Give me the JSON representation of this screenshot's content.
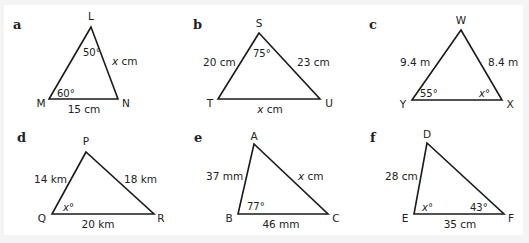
{
  "figure": {
    "problems": [
      {
        "label": "a",
        "label_pos": [
          13,
          29
        ],
        "vertices": [
          {
            "name": "L",
            "x": 91,
            "y": 27,
            "label_x": 91,
            "label_y": 20,
            "anchor": "middle"
          },
          {
            "name": "M",
            "x": 49,
            "y": 99,
            "label_x": 41,
            "label_y": 107,
            "anchor": "middle"
          },
          {
            "name": "N",
            "x": 118,
            "y": 99,
            "label_x": 126,
            "label_y": 107,
            "anchor": "middle"
          }
        ],
        "measures": [
          {
            "text": "x cm",
            "italic_prefix": "x",
            "rest": " cm",
            "x": 112,
            "y": 65,
            "anchor": "start",
            "kind": "side"
          },
          {
            "text": "15 cm",
            "italic_prefix": "",
            "rest": "15 cm",
            "x": 84,
            "y": 113,
            "anchor": "middle",
            "kind": "side"
          }
        ],
        "angles": [
          {
            "text": "50°",
            "italic_prefix": "",
            "rest": "50°",
            "x": 83,
            "y": 56,
            "anchor": "start"
          },
          {
            "text": "60°",
            "italic_prefix": "",
            "rest": "60°",
            "x": 57,
            "y": 97,
            "anchor": "start"
          }
        ]
      },
      {
        "label": "b",
        "label_pos": [
          193,
          29
        ],
        "vertices": [
          {
            "name": "S",
            "x": 259,
            "y": 33,
            "label_x": 259,
            "label_y": 27,
            "anchor": "middle"
          },
          {
            "name": "T",
            "x": 218,
            "y": 99,
            "label_x": 210,
            "label_y": 107,
            "anchor": "middle"
          },
          {
            "name": "U",
            "x": 320,
            "y": 99,
            "label_x": 329,
            "label_y": 107,
            "anchor": "middle"
          }
        ],
        "measures": [
          {
            "text": "20 cm",
            "italic_prefix": "",
            "rest": "20 cm",
            "x": 203,
            "y": 66,
            "anchor": "start",
            "kind": "side"
          },
          {
            "text": "23 cm",
            "italic_prefix": "",
            "rest": "23 cm",
            "x": 297,
            "y": 66,
            "anchor": "start",
            "kind": "side"
          },
          {
            "text": "x cm",
            "italic_prefix": "x",
            "rest": " cm",
            "x": 270,
            "y": 113,
            "anchor": "middle",
            "kind": "side"
          }
        ],
        "angles": [
          {
            "text": "75°",
            "italic_prefix": "",
            "rest": "75°",
            "x": 253,
            "y": 57,
            "anchor": "start"
          }
        ]
      },
      {
        "label": "c",
        "label_pos": [
          369,
          29
        ],
        "vertices": [
          {
            "name": "W",
            "x": 461,
            "y": 30,
            "label_x": 461,
            "label_y": 24,
            "anchor": "middle"
          },
          {
            "name": "Y",
            "x": 412,
            "y": 100,
            "label_x": 403,
            "label_y": 108,
            "anchor": "middle"
          },
          {
            "name": "X",
            "x": 502,
            "y": 100,
            "label_x": 510,
            "label_y": 108,
            "anchor": "middle"
          }
        ],
        "measures": [
          {
            "text": "9.4 m",
            "italic_prefix": "",
            "rest": "9.4 m",
            "x": 400,
            "y": 66,
            "anchor": "start",
            "kind": "side"
          },
          {
            "text": "8.4 m",
            "italic_prefix": "",
            "rest": "8.4 m",
            "x": 488,
            "y": 66,
            "anchor": "start",
            "kind": "side"
          }
        ],
        "angles": [
          {
            "text": "55°",
            "italic_prefix": "",
            "rest": "55°",
            "x": 420,
            "y": 97,
            "anchor": "start"
          },
          {
            "text": "x°",
            "italic_prefix": "x",
            "rest": "°",
            "x": 479,
            "y": 97,
            "anchor": "start"
          }
        ]
      },
      {
        "label": "d",
        "label_pos": [
          17,
          142
        ],
        "vertices": [
          {
            "name": "P",
            "x": 86,
            "y": 152,
            "label_x": 86,
            "label_y": 145,
            "anchor": "middle"
          },
          {
            "name": "Q",
            "x": 52,
            "y": 214,
            "label_x": 42,
            "label_y": 222,
            "anchor": "middle"
          },
          {
            "name": "R",
            "x": 154,
            "y": 214,
            "label_x": 161,
            "label_y": 222,
            "anchor": "middle"
          }
        ],
        "measures": [
          {
            "text": "14 km",
            "italic_prefix": "",
            "rest": "14 km",
            "x": 34,
            "y": 183,
            "anchor": "start",
            "kind": "side"
          },
          {
            "text": "18 km",
            "italic_prefix": "",
            "rest": "18 km",
            "x": 124,
            "y": 183,
            "anchor": "start",
            "kind": "side"
          },
          {
            "text": "20 km",
            "italic_prefix": "",
            "rest": "20 km",
            "x": 98,
            "y": 228,
            "anchor": "middle",
            "kind": "side"
          }
        ],
        "angles": [
          {
            "text": "x°",
            "italic_prefix": "x",
            "rest": "°",
            "x": 63,
            "y": 211,
            "anchor": "start"
          }
        ]
      },
      {
        "label": "e",
        "label_pos": [
          194,
          142
        ],
        "vertices": [
          {
            "name": "A",
            "x": 254,
            "y": 144,
            "label_x": 254,
            "label_y": 140,
            "anchor": "middle"
          },
          {
            "name": "B",
            "x": 238,
            "y": 214,
            "label_x": 229,
            "label_y": 222,
            "anchor": "middle"
          },
          {
            "name": "C",
            "x": 328,
            "y": 214,
            "label_x": 336,
            "label_y": 222,
            "anchor": "middle"
          }
        ],
        "measures": [
          {
            "text": "37 mm",
            "italic_prefix": "",
            "rest": "37 mm",
            "x": 206,
            "y": 180,
            "anchor": "start",
            "kind": "side"
          },
          {
            "text": "x cm",
            "italic_prefix": "x",
            "rest": " cm",
            "x": 298,
            "y": 180,
            "anchor": "start",
            "kind": "side"
          },
          {
            "text": "46 mm",
            "italic_prefix": "",
            "rest": "46 mm",
            "x": 281,
            "y": 228,
            "anchor": "middle",
            "kind": "side"
          }
        ],
        "angles": [
          {
            "text": "77°",
            "italic_prefix": "",
            "rest": "77°",
            "x": 247,
            "y": 210,
            "anchor": "start"
          }
        ]
      },
      {
        "label": "f",
        "label_pos": [
          370,
          142
        ],
        "vertices": [
          {
            "name": "D",
            "x": 427,
            "y": 143,
            "label_x": 427,
            "label_y": 138,
            "anchor": "middle"
          },
          {
            "name": "E",
            "x": 414,
            "y": 214,
            "label_x": 405,
            "label_y": 222,
            "anchor": "middle"
          },
          {
            "name": "F",
            "x": 504,
            "y": 214,
            "label_x": 511,
            "label_y": 222,
            "anchor": "middle"
          }
        ],
        "measures": [
          {
            "text": "28 cm",
            "italic_prefix": "",
            "rest": "28 cm",
            "x": 385,
            "y": 180,
            "anchor": "start",
            "kind": "side"
          },
          {
            "text": "35 cm",
            "italic_prefix": "",
            "rest": "35 cm",
            "x": 460,
            "y": 228,
            "anchor": "middle",
            "kind": "side"
          }
        ],
        "angles": [
          {
            "text": "x°",
            "italic_prefix": "x",
            "rest": "°",
            "x": 422,
            "y": 211,
            "anchor": "start"
          },
          {
            "text": "43°",
            "italic_prefix": "",
            "rest": "43°",
            "x": 470,
            "y": 211,
            "anchor": "start"
          }
        ]
      }
    ],
    "colors": {
      "stroke": "#1a1a1a",
      "text": "#222222",
      "background": "#ffffff",
      "frame": "#f4f4f4"
    }
  }
}
